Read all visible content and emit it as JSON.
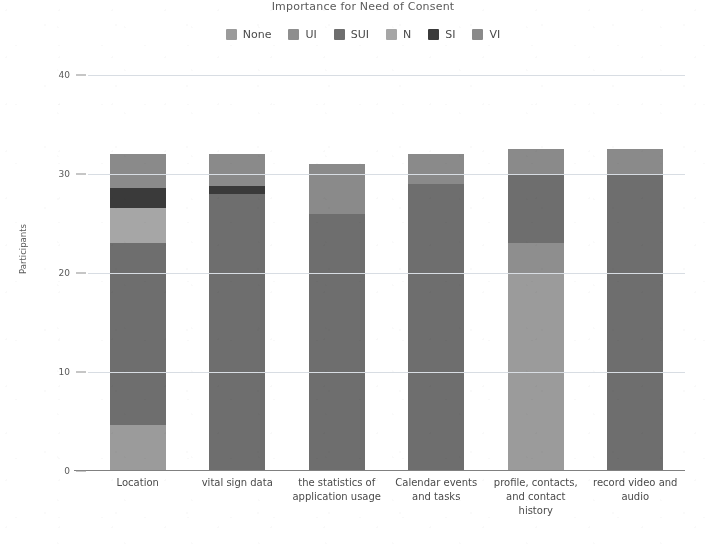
{
  "chart_data": {
    "type": "bar",
    "subtype": "stacked-bar",
    "title": "Importance for Need of Consent",
    "xlabel": "",
    "ylabel": "Participants",
    "ylim": [
      0,
      40
    ],
    "yticks": [
      0,
      10,
      20,
      30,
      40
    ],
    "ytick_labels": [
      "0",
      "10",
      "20",
      "30",
      "40"
    ],
    "grid": true,
    "legend_position": "top-center",
    "categories": [
      "Location",
      "vital sign data",
      "the statistics of application usage",
      "Calendar events and tasks",
      "profile, contacts, and contact history",
      "record video and audio"
    ],
    "series": [
      {
        "name": "None",
        "color": "#9b9b9b",
        "values": [
          4.6,
          0,
          0,
          0,
          20,
          0
        ]
      },
      {
        "name": "UI",
        "color": "#8e8e8e",
        "values": [
          0,
          0,
          0,
          0,
          3,
          0
        ]
      },
      {
        "name": "SUI",
        "color": "#6e6e6e",
        "values": [
          18.4,
          28,
          26,
          29,
          7,
          30
        ]
      },
      {
        "name": "N",
        "color": "#a6a6a6",
        "values": [
          3.6,
          0,
          0,
          0,
          0,
          0
        ]
      },
      {
        "name": "SI",
        "color": "#3a3a3a",
        "values": [
          2,
          0.8,
          0,
          0,
          0,
          0
        ]
      },
      {
        "name": "VI",
        "color": "#8a8a8a",
        "values": [
          3.4,
          3.2,
          5,
          3,
          2.5,
          2.5
        ]
      }
    ],
    "totals": [
      32,
      32,
      31,
      32,
      32.5,
      32.5
    ]
  },
  "legend": {
    "items": [
      {
        "label": "None",
        "color": "#9b9b9b"
      },
      {
        "label": "UI",
        "color": "#8e8e8e"
      },
      {
        "label": "SUI",
        "color": "#6e6e6e"
      },
      {
        "label": "N",
        "color": "#a6a6a6"
      },
      {
        "label": "SI",
        "color": "#3a3a3a"
      },
      {
        "label": "VI",
        "color": "#8a8a8a"
      }
    ]
  },
  "axes": {
    "y_title": "Participants",
    "y_tick_labels": [
      "40",
      "30",
      "20",
      "10",
      "0"
    ]
  },
  "colors": {
    "gridline": "#d8dde3",
    "axis": "#808080",
    "text": "#4a4a4a",
    "background": "#ffffff"
  }
}
